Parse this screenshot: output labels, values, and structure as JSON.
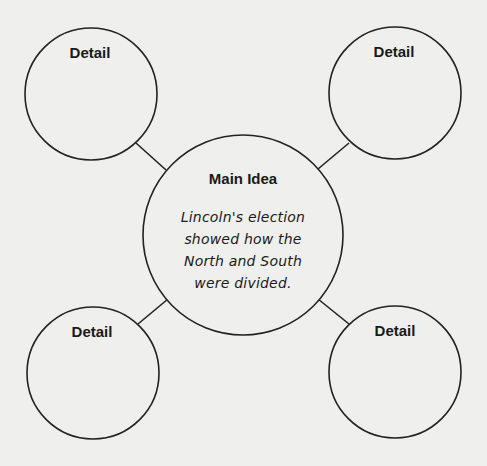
{
  "diagram": {
    "type": "main-idea-and-details web",
    "main": {
      "title": "Main Idea",
      "text_lines": [
        "Lincoln's election",
        "showed how the",
        "North and South",
        "were divided."
      ]
    },
    "details": [
      {
        "position": "top-left",
        "label": "Detail"
      },
      {
        "position": "top-right",
        "label": "Detail"
      },
      {
        "position": "bottom-left",
        "label": "Detail"
      },
      {
        "position": "bottom-right",
        "label": "Detail"
      }
    ],
    "colors": {
      "background": "#efefed",
      "stroke": "#222222",
      "text": "#1a1a1a"
    }
  }
}
